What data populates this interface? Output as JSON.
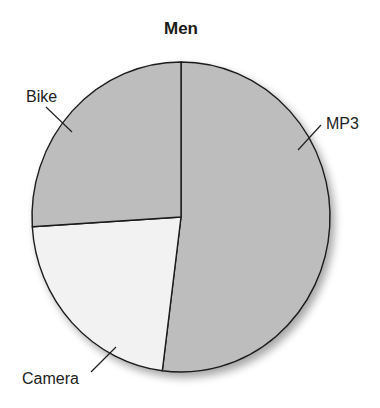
{
  "chart_data": {
    "type": "pie",
    "title": "Men",
    "start_angle_deg": 0,
    "direction": "clockwise",
    "slices": [
      {
        "label": "MP3",
        "value": 52,
        "color": "#bdbdbd"
      },
      {
        "label": "Camera",
        "value": 22,
        "color": "#f2f2f2"
      },
      {
        "label": "Bike",
        "value": 26,
        "color": "#bdbdbd"
      }
    ],
    "legend": "none",
    "labels_style": "leader-lines"
  }
}
